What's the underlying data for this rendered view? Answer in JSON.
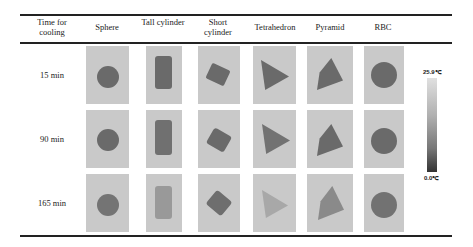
{
  "table": {
    "headers": [
      "Time for cooling",
      "Sphere",
      "Tall cylinder",
      "Short cylinder",
      "Tetrahedron",
      "Pyramid",
      "RBC"
    ],
    "rows": [
      {
        "time": "15 min"
      },
      {
        "time": "90 min"
      },
      {
        "time": "165 min"
      }
    ]
  },
  "colorbar": {
    "max_label": "25.9℃",
    "min_label": "0.0℃"
  }
}
